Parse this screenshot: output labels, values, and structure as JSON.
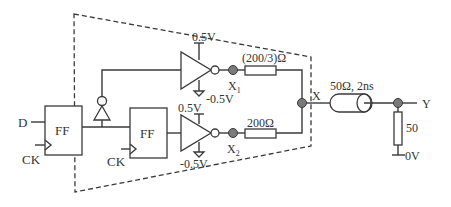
{
  "diagram": {
    "type": "circuit-schematic",
    "inputs": {
      "d_label": "D",
      "ck1_label": "CK",
      "ck2_label": "CK"
    },
    "flipflops": [
      {
        "label": "FF"
      },
      {
        "label": "FF"
      }
    ],
    "drivers": {
      "top": {
        "vplus": "0.5V",
        "vminus": "-0.5V",
        "node_label": "X",
        "node_sub": "1"
      },
      "bottom": {
        "vplus": "0.5V",
        "vminus": "-0.5V",
        "node_label": "X",
        "node_sub": "2"
      }
    },
    "resistors": {
      "top": "(200/3)Ω",
      "bottom": "200Ω",
      "load": "50"
    },
    "nodes": {
      "x_label": "X",
      "y_label": "Y"
    },
    "transmission_line": {
      "label": "50Ω, 2ns"
    },
    "ground": {
      "label": "0V"
    },
    "colors": {
      "line": "#3a3a3a",
      "node_fill": "#7a7a7a",
      "background": "#ffffff"
    }
  }
}
